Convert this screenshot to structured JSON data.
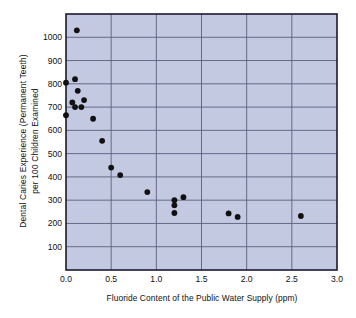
{
  "chart_data": {
    "type": "scatter",
    "title": "",
    "xlabel": "Fluoride Content of the Public Water Supply (ppm)",
    "ylabel": "Dental Caries Experience (Permanent Teeth) per 100 Children Examined",
    "ylabel_line1": "Dental Caries Experience (Permanent Teeth)",
    "ylabel_line2": "per 100 Children Examined",
    "xlim": [
      0.0,
      3.0
    ],
    "ylim": [
      0,
      1100
    ],
    "xticks": [
      "0.0",
      "0.5",
      "1.0",
      "1.5",
      "2.0",
      "2.5",
      "3.0"
    ],
    "xtick_values": [
      0.0,
      0.5,
      1.0,
      1.5,
      2.0,
      2.5,
      3.0
    ],
    "yticks": [
      "100",
      "200",
      "300",
      "400",
      "500",
      "600",
      "700",
      "800",
      "900",
      "1000"
    ],
    "ytick_values": [
      100,
      200,
      300,
      400,
      500,
      600,
      700,
      800,
      900,
      1000
    ],
    "grid": true,
    "grid_axis": "both",
    "legend": false,
    "plot_bgcolor": "#c4c9e2",
    "grid_color": "#5a5f7d",
    "marker_color": "#111111",
    "frame_color": "#1a1a2e",
    "x": [
      0.12,
      0.0,
      0.1,
      0.13,
      0.07,
      0.2,
      0.1,
      0.17,
      0.0,
      0.3,
      0.4,
      0.5,
      0.6,
      0.9,
      1.2,
      1.2,
      1.2,
      1.3,
      1.8,
      1.9,
      2.6
    ],
    "y": [
      1030,
      805,
      820,
      770,
      720,
      730,
      700,
      700,
      665,
      650,
      555,
      440,
      408,
      335,
      300,
      278,
      245,
      313,
      243,
      228,
      232
    ],
    "points": [
      {
        "x": 0.12,
        "y": 1030
      },
      {
        "x": 0.0,
        "y": 805
      },
      {
        "x": 0.1,
        "y": 820
      },
      {
        "x": 0.13,
        "y": 770
      },
      {
        "x": 0.07,
        "y": 720
      },
      {
        "x": 0.2,
        "y": 730
      },
      {
        "x": 0.1,
        "y": 700
      },
      {
        "x": 0.17,
        "y": 700
      },
      {
        "x": 0.0,
        "y": 665
      },
      {
        "x": 0.3,
        "y": 650
      },
      {
        "x": 0.4,
        "y": 555
      },
      {
        "x": 0.5,
        "y": 440
      },
      {
        "x": 0.6,
        "y": 408
      },
      {
        "x": 0.9,
        "y": 335
      },
      {
        "x": 1.2,
        "y": 300
      },
      {
        "x": 1.2,
        "y": 278
      },
      {
        "x": 1.2,
        "y": 245
      },
      {
        "x": 1.3,
        "y": 313
      },
      {
        "x": 1.8,
        "y": 243
      },
      {
        "x": 1.9,
        "y": 228
      },
      {
        "x": 2.6,
        "y": 232
      }
    ]
  }
}
